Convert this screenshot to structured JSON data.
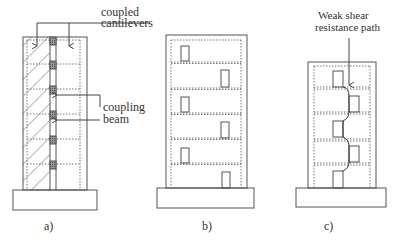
{
  "figure": {
    "panels": [
      {
        "id": "a",
        "caption": "a)",
        "title": "Coupled wall (coupled cantilevers)",
        "annotations": {
          "top_label_line1": "coupled",
          "top_label_line2": "cantilevers",
          "side_label_line1": "coupling",
          "side_label_line2": "beam"
        },
        "stories": 6
      },
      {
        "id": "b",
        "caption": "b)",
        "title": "Wall with staggered openings",
        "stories": 6
      },
      {
        "id": "c",
        "caption": "c)",
        "annotations": {
          "label_line1": "Weak shear",
          "label_line2": "resistance path"
        },
        "stories": 5
      }
    ],
    "colors": {
      "line": "#555555",
      "dotted": "#777777",
      "hatch": "#666666",
      "beam_fill": "#888888",
      "text": "#333333"
    }
  }
}
